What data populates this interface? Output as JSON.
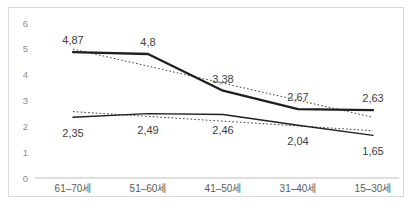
{
  "chart_data": {
    "type": "line",
    "title": "",
    "categories": [
      "61–70세",
      "51–60세",
      "41–50세",
      "31–40세",
      "15–30세"
    ],
    "series": [
      {
        "name": "upper-series",
        "values": [
          4.87,
          4.8,
          3.38,
          2.67,
          2.63
        ],
        "labels": [
          "4,87",
          "4,8",
          "3,38",
          "2,67",
          "2,63"
        ],
        "style": "solid-thick"
      },
      {
        "name": "lower-series",
        "values": [
          2.35,
          2.49,
          2.46,
          2.04,
          1.65
        ],
        "labels": [
          "2,35",
          "2,49",
          "2,46",
          "2,04",
          "1,65"
        ],
        "style": "solid-thin"
      }
    ],
    "trendlines": [
      {
        "series": 0,
        "start": 4.99,
        "end": 2.35,
        "style": "dotted"
      },
      {
        "series": 1,
        "start": 2.57,
        "end": 1.83,
        "style": "dotted"
      }
    ],
    "yticks": [
      "0",
      "1",
      "2",
      "3",
      "4",
      "5",
      "6"
    ],
    "ylim": [
      0,
      6
    ],
    "xlabel": "",
    "ylabel": "",
    "grid": false,
    "legend": "none",
    "colors": {
      "series_line": "#1f1f1f",
      "trendline": "#404040",
      "data_label": "#404040",
      "tick_label": "#8c8c8c",
      "category_label": "#595959",
      "frame_border": "#d9d9d9",
      "axis_line": "#bfbfbf",
      "background": "#ffffff"
    }
  }
}
